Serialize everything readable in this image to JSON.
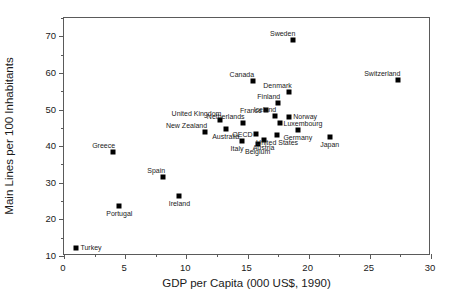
{
  "chart_data": {
    "type": "scatter",
    "title": "",
    "xlabel": "GDP per Capita (000 US$, 1990)",
    "ylabel": "Main Lines per 100 Inhabitants",
    "xlim": [
      0,
      30
    ],
    "ylim": [
      10,
      75
    ],
    "x_ticks": [
      0,
      5,
      10,
      15,
      20,
      25,
      30
    ],
    "x_tick_labels": [
      "0",
      "5",
      "10",
      "15",
      "20",
      "25",
      "30"
    ],
    "x_minor_ticks": [
      2.5,
      7.5,
      12.5,
      17.5,
      22.5,
      27.5
    ],
    "y_ticks": [
      10,
      20,
      30,
      40,
      50,
      60,
      70
    ],
    "y_tick_labels": [
      "10",
      "20",
      "30",
      "40",
      "50",
      "60",
      "70"
    ],
    "y_minor_ticks": [
      15,
      25,
      35,
      45,
      55,
      65,
      75
    ],
    "grid": false,
    "legend": null,
    "marker": "square",
    "marker_color": "#000000",
    "points": [
      {
        "label": "Turkey",
        "x": 1.1,
        "y": 12.0,
        "label_pos": "right"
      },
      {
        "label": "Greece",
        "x": 4.1,
        "y": 38.0,
        "label_pos": "above-left"
      },
      {
        "label": "Portugal",
        "x": 4.6,
        "y": 23.5,
        "label_pos": "below"
      },
      {
        "label": "Spain",
        "x": 8.2,
        "y": 31.3,
        "label_pos": "above-left"
      },
      {
        "label": "Ireland",
        "x": 9.5,
        "y": 26.2,
        "label_pos": "below"
      },
      {
        "label": "New Zealand",
        "x": 11.6,
        "y": 43.6,
        "label_pos": "above-left"
      },
      {
        "label": "United Kingdom",
        "x": 12.8,
        "y": 46.8,
        "label_pos": "above-left"
      },
      {
        "label": "Australia",
        "x": 13.3,
        "y": 44.5,
        "label_pos": "below"
      },
      {
        "label": "Italy",
        "x": 14.6,
        "y": 41.2,
        "label_pos": "below-left"
      },
      {
        "label": "Netherlands",
        "x": 14.7,
        "y": 46.1,
        "label_pos": "above-left"
      },
      {
        "label": "Canada",
        "x": 15.5,
        "y": 57.6,
        "label_pos": "above-left"
      },
      {
        "label": "OECD",
        "x": 15.8,
        "y": 43.0,
        "label_pos": "left"
      },
      {
        "label": "Belgium",
        "x": 15.9,
        "y": 40.3,
        "label_pos": "below"
      },
      {
        "label": "Austria",
        "x": 16.4,
        "y": 41.5,
        "label_pos": "below"
      },
      {
        "label": "France",
        "x": 16.6,
        "y": 49.5,
        "label_pos": "left"
      },
      {
        "label": "Iceland",
        "x": 17.3,
        "y": 48.0,
        "label_pos": "above-left"
      },
      {
        "label": "United States",
        "x": 17.5,
        "y": 42.8,
        "label_pos": "below"
      },
      {
        "label": "Finland",
        "x": 17.6,
        "y": 51.5,
        "label_pos": "above-left"
      },
      {
        "label": "Luxembourg",
        "x": 17.7,
        "y": 46.0,
        "label_pos": "right"
      },
      {
        "label": "Denmark",
        "x": 18.5,
        "y": 54.5,
        "label_pos": "above-left"
      },
      {
        "label": "Norway",
        "x": 18.5,
        "y": 47.8,
        "label_pos": "right"
      },
      {
        "label": "Sweden",
        "x": 18.8,
        "y": 68.8,
        "label_pos": "above-left"
      },
      {
        "label": "Germany",
        "x": 19.2,
        "y": 44.2,
        "label_pos": "below"
      },
      {
        "label": "Japan",
        "x": 21.8,
        "y": 42.2,
        "label_pos": "below"
      },
      {
        "label": "Switzerland",
        "x": 27.4,
        "y": 57.9,
        "label_pos": "above-left"
      }
    ]
  }
}
